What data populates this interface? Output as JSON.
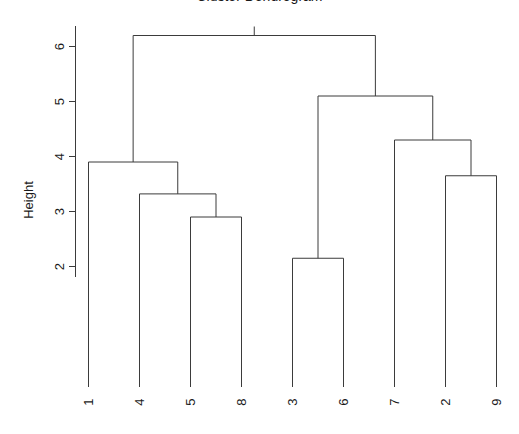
{
  "plot": {
    "title": "Cluster Dendrogram",
    "title_visible_fragment": "g",
    "ylabel": "Height",
    "xlabel": ""
  },
  "chart_data": {
    "type": "line",
    "subtype": "dendrogram",
    "title": "Cluster Dendrogram",
    "xlabel": "",
    "ylabel": "Height",
    "ylim": [
      1.55,
      6.45
    ],
    "grid": false,
    "legend": null,
    "y_ticks": [
      2,
      3,
      4,
      5,
      6
    ],
    "y_tick_labels": [
      "2",
      "3",
      "4",
      "5",
      "6"
    ],
    "leaf_order": [
      "1",
      "4",
      "5",
      "8",
      "3",
      "6",
      "7",
      "2",
      "9"
    ],
    "leaf_labels": [
      "1",
      "4",
      "5",
      "8",
      "3",
      "6",
      "7",
      "2",
      "9"
    ],
    "leaf_label_rotation": 90,
    "n_leaves": 9,
    "merges": [
      {
        "id": "m1",
        "left": "5",
        "right": "8",
        "height": 2.9
      },
      {
        "id": "m2",
        "left": "3",
        "right": "6",
        "height": 2.15
      },
      {
        "id": "m3",
        "left": "4",
        "right": "m1",
        "height": 3.32
      },
      {
        "id": "m4",
        "left": "2",
        "right": "9",
        "height": 3.65
      },
      {
        "id": "m5",
        "left": "1",
        "right": "m3",
        "height": 3.9
      },
      {
        "id": "m6",
        "left": "7",
        "right": "m4",
        "height": 4.3
      },
      {
        "id": "m7",
        "left": "m2",
        "right": "m6",
        "height": 5.1
      },
      {
        "id": "m8",
        "left": "m5",
        "right": "m7",
        "height": 6.2
      }
    ],
    "merge_heights": [
      2.9,
      2.15,
      3.32,
      3.65,
      3.9,
      4.3,
      5.1,
      6.2
    ],
    "root_height": 6.2
  },
  "y_axis": {
    "ticks": [
      {
        "label": "6",
        "value": 6
      },
      {
        "label": "5",
        "value": 5
      },
      {
        "label": "4",
        "value": 4
      },
      {
        "label": "3",
        "value": 3
      },
      {
        "label": "2",
        "value": 2
      }
    ]
  },
  "x_axis": {
    "ticks": [
      {
        "label": "1"
      },
      {
        "label": "4"
      },
      {
        "label": "5"
      },
      {
        "label": "8"
      },
      {
        "label": "3"
      },
      {
        "label": "6"
      },
      {
        "label": "7"
      },
      {
        "label": "2"
      },
      {
        "label": "9"
      }
    ]
  },
  "colors": {
    "background": "#ffffff",
    "line": "#3b3b3b",
    "text": "#1a1a1a"
  }
}
